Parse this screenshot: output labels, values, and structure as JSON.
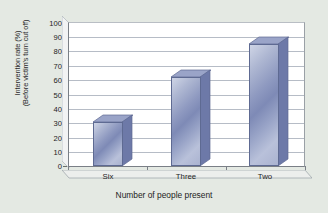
{
  "chart_data": {
    "type": "bar",
    "title": "",
    "categories": [
      "Six",
      "Three",
      "Two"
    ],
    "values": [
      31,
      62,
      85
    ],
    "series": [
      {
        "name": "Intervention rate",
        "values": [
          31,
          62,
          85
        ]
      }
    ],
    "xlabel": "Number of people present",
    "ylabel_line1": "Intervention rate (%)",
    "ylabel_line2": "(Before victim's turn cut off)",
    "ylim": [
      0,
      100
    ],
    "ytick_step": 10,
    "yticks": [
      "100",
      "90",
      "80",
      "70",
      "60",
      "50",
      "40",
      "30",
      "20",
      "10",
      "0"
    ],
    "grid": true,
    "legend": "none",
    "style": "3d-column",
    "colors": {
      "bar_light": "#cfd5e6",
      "bar_mid": "#8e99c0",
      "bar_dark": "#5d6a9c",
      "bar_edge": "#5e6a92",
      "plot_background": "#ffffff",
      "page_background": "#e4e9e3",
      "gridline": "#b6bcc6",
      "axis": "#7a7f86",
      "text": "#1d1d1d"
    }
  }
}
